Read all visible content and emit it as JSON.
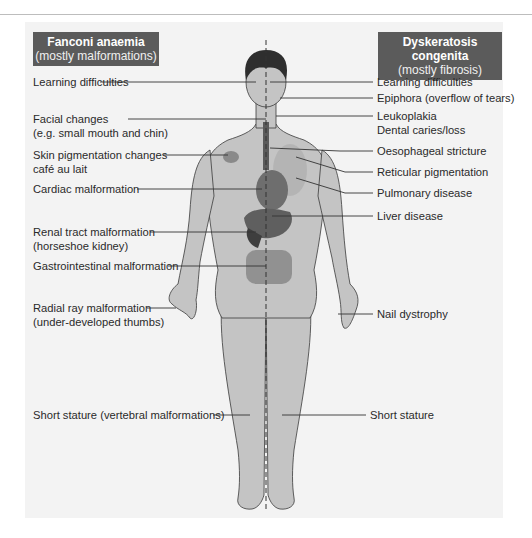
{
  "left_panel": {
    "title": "Fanconi anaemia",
    "subtitle": "(mostly malformations)",
    "labels": [
      {
        "line1": "Learning difficulties",
        "line2": ""
      },
      {
        "line1": "Facial changes",
        "line2": "(e.g. small mouth and chin)"
      },
      {
        "line1": "Skin pigmentation changes",
        "line2": "café au lait"
      },
      {
        "line1": "Cardiac malformation",
        "line2": ""
      },
      {
        "line1": "Renal tract malformation",
        "line2": "(horseshoe kidney)"
      },
      {
        "line1": "Gastrointestinal malformation",
        "line2": ""
      },
      {
        "line1": "Radial ray malformation",
        "line2": "(under-developed thumbs)"
      },
      {
        "line1": "Short stature (vertebral malformations)",
        "line2": ""
      }
    ]
  },
  "right_panel": {
    "title": "Dyskeratosis congenita",
    "subtitle": "(mostly fibrosis)",
    "labels": [
      {
        "line1": "Learning difficulties",
        "line2": ""
      },
      {
        "line1": "Epiphora (overflow of tears)",
        "line2": ""
      },
      {
        "line1": "Leukoplakia",
        "line2": "Dental caries/loss"
      },
      {
        "line1": "Oesophageal stricture",
        "line2": ""
      },
      {
        "line1": "Reticular pigmentation",
        "line2": ""
      },
      {
        "line1": "Pulmonary disease",
        "line2": ""
      },
      {
        "line1": "Liver disease",
        "line2": ""
      },
      {
        "line1": "Nail dystrophy",
        "line2": ""
      },
      {
        "line1": "Short stature",
        "line2": ""
      }
    ]
  },
  "colors": {
    "header_bg": "#5b5b5b",
    "panel_bg": "#f3f3f3",
    "skin": "#c4c4c4",
    "organ": "#6e6e6e",
    "hair": "#2e2e2e"
  }
}
